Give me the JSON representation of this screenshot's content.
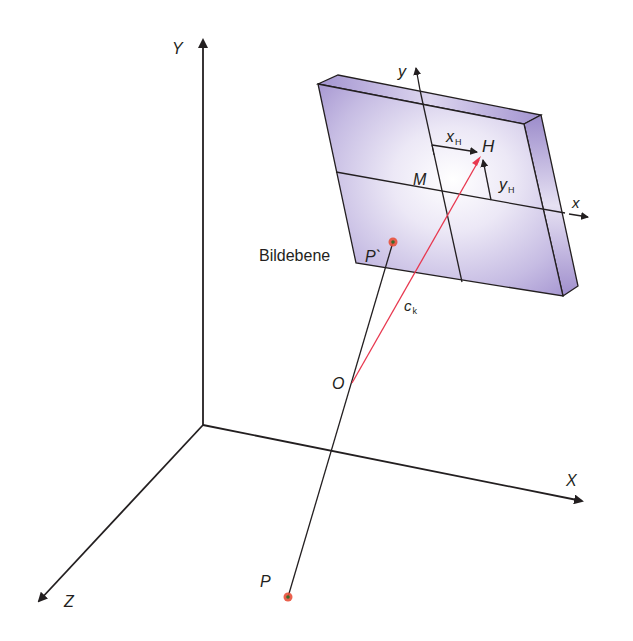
{
  "figure": {
    "labels": {
      "axis_Y": "Y",
      "axis_X": "X",
      "axis_Z": "Z",
      "image_y": "y",
      "image_x": "x",
      "x_H": "x",
      "x_H_sub": "H",
      "y_H": "y",
      "y_H_sub": "H",
      "H": "H",
      "M": "M",
      "P_prime": "P`",
      "O": "O",
      "P": "P",
      "c_k": "c",
      "c_k_sub": "k",
      "image_plane": "Bildebene"
    },
    "colors": {
      "line": "#231f20",
      "principal_ray": "#e8384f",
      "plate_face": "#b9addb",
      "plate_edge": "#9587c4",
      "point_fill": "#e8503a",
      "point_core": "#3a6b2a"
    },
    "points": {
      "origin": [
        203,
        425
      ],
      "O": [
        352,
        383
      ],
      "P": [
        288,
        597
      ],
      "P_prime": [
        393,
        242
      ],
      "H": [
        481,
        157
      ],
      "M": [
        442,
        193
      ]
    }
  }
}
